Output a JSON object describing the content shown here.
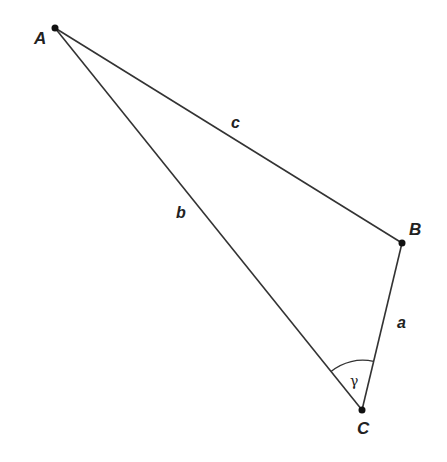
{
  "diagram": {
    "type": "triangle",
    "colors": {
      "line": "#333333",
      "point": "#111111",
      "text": "#222222",
      "background": "#ffffff"
    },
    "vertices": [
      {
        "id": "A",
        "label": "A",
        "x": 55,
        "y": 28,
        "label_x": 34,
        "label_y": 44
      },
      {
        "id": "B",
        "label": "B",
        "x": 402,
        "y": 243,
        "label_x": 409,
        "label_y": 235
      },
      {
        "id": "C",
        "label": "C",
        "x": 362,
        "y": 410,
        "label_x": 357,
        "label_y": 434
      }
    ],
    "sides": [
      {
        "id": "a",
        "label": "a",
        "from": "B",
        "to": "C",
        "label_x": 397,
        "label_y": 328
      },
      {
        "id": "b",
        "label": "b",
        "from": "A",
        "to": "C",
        "label_x": 176,
        "label_y": 218
      },
      {
        "id": "c",
        "label": "c",
        "from": "A",
        "to": "B",
        "label_x": 231,
        "label_y": 128
      }
    ],
    "angles": [
      {
        "id": "gamma",
        "label": "γ",
        "vertex": "C",
        "label_x": 352,
        "label_y": 384
      }
    ]
  }
}
